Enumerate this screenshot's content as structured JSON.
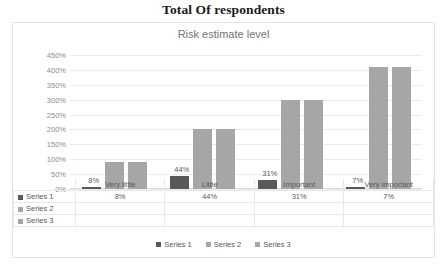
{
  "title": "Total Of respondents",
  "subtitle": "Risk estimate level",
  "colors": {
    "series1": "#595959",
    "series2": "#a6a6a6",
    "series3": "#a6a6a6",
    "grid": "#ececec",
    "text": "#595959"
  },
  "legend": {
    "items": [
      {
        "label": "Series 1"
      },
      {
        "label": "Series 2"
      },
      {
        "label": "Series 3"
      }
    ]
  },
  "table": {
    "row_labels": [
      "Series 1",
      "Series 2",
      "Series 3"
    ],
    "rows": [
      [
        "8%",
        "44%",
        "31%",
        "7%"
      ],
      [
        "",
        "",
        "",
        ""
      ],
      [
        "",
        "",
        "",
        ""
      ]
    ]
  },
  "chart_data": {
    "type": "bar",
    "title": "Total Of respondents",
    "subtitle": "Risk estimate level",
    "xlabel": "",
    "ylabel": "",
    "ylim": [
      0,
      450
    ],
    "yticks": [
      "0%",
      "50%",
      "100%",
      "150%",
      "200%",
      "250%",
      "300%",
      "350%",
      "400%",
      "450%"
    ],
    "ytick_values": [
      0,
      50,
      100,
      150,
      200,
      250,
      300,
      350,
      400,
      450
    ],
    "grid": true,
    "legend_position": "bottom",
    "categories": [
      "Very little",
      "Little",
      "Important",
      "Very important"
    ],
    "series": [
      {
        "name": "Series 1",
        "values": [
          8,
          44,
          31,
          7
        ],
        "labels": [
          "8%",
          "44%",
          "31%",
          "7%"
        ],
        "color": "#595959"
      },
      {
        "name": "Series 2",
        "values": [
          90,
          200,
          300,
          410
        ],
        "labels": [
          "",
          "",
          "",
          ""
        ],
        "color": "#a6a6a6"
      },
      {
        "name": "Series 3",
        "values": [
          90,
          200,
          300,
          410
        ],
        "labels": [
          "",
          "",
          "",
          ""
        ],
        "color": "#a6a6a6"
      }
    ]
  }
}
